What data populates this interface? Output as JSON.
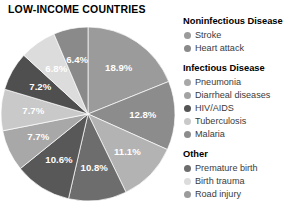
{
  "title": "LOW-INCOME COUNTRIES",
  "chart_data": {
    "type": "pie",
    "title": "LOW-INCOME COUNTRIES",
    "xlabel": "",
    "ylabel": "",
    "legend_position": "right",
    "grid": false,
    "unit": "%",
    "categories": [
      "Stroke",
      "Heart attack",
      "Pneumonia",
      "Diarrheal diseases",
      "HIV/AIDS",
      "Tuberculosis",
      "Malaria",
      "Premature birth",
      "Birth trauma",
      "Road injury"
    ],
    "values": [
      18.9,
      12.8,
      11.1,
      10.8,
      10.6,
      7.7,
      7.7,
      7.2,
      6.8,
      6.4
    ],
    "labels": [
      "18.9%",
      "12.8%",
      "11.1%",
      "10.8%",
      "10.6%",
      "7.7%",
      "7.7%",
      "7.2%",
      "6.8%",
      "6.4%"
    ],
    "colors": [
      "#9b9b9b",
      "#8c8c8c",
      "#b3b3b3",
      "#6d6d6d",
      "#585858",
      "#a8a8a8",
      "#c9c9c9",
      "#4f4f4f",
      "#dcdcdc",
      "#8a8a8a"
    ],
    "slices": [
      {
        "label": "18.9%",
        "value": 18.9,
        "color": "#9b9b9b",
        "name": "Stroke"
      },
      {
        "label": "12.8%",
        "value": 12.8,
        "color": "#8c8c8c",
        "name": "Heart attack"
      },
      {
        "label": "11.1%",
        "value": 11.1,
        "color": "#b3b3b3",
        "name": "Pneumonia"
      },
      {
        "label": "10.8%",
        "value": 10.8,
        "color": "#6d6d6d",
        "name": "Diarrheal diseases"
      },
      {
        "label": "10.6%",
        "value": 10.6,
        "color": "#585858",
        "name": "HIV/AIDS"
      },
      {
        "label": "7.7%",
        "value": 7.7,
        "color": "#a8a8a8",
        "name": "Tuberculosis"
      },
      {
        "label": "7.7%",
        "value": 7.7,
        "color": "#c9c9c9",
        "name": "Malaria"
      },
      {
        "label": "7.2%",
        "value": 7.2,
        "color": "#4f4f4f",
        "name": "Premature birth"
      },
      {
        "label": "6.8%",
        "value": 6.8,
        "color": "#dcdcdc",
        "name": "Birth trauma"
      },
      {
        "label": "6.4%",
        "value": 6.4,
        "color": "#8a8a8a",
        "name": "Road injury"
      }
    ]
  },
  "legend": {
    "groups": [
      {
        "heading": "Noninfectious Disease",
        "items": [
          {
            "label": "Stroke",
            "color": "#9b9b9b"
          },
          {
            "label": "Heart attack",
            "color": "#8a8a8a"
          }
        ]
      },
      {
        "heading": "Infectious Disease",
        "items": [
          {
            "label": "Pneumonia",
            "color": "#a8a8a8"
          },
          {
            "label": "Diarrheal diseases",
            "color": "#a3a3a3"
          },
          {
            "label": "HIV/AIDS",
            "color": "#545454"
          },
          {
            "label": "Tuberculosis",
            "color": "#c9c9c9"
          },
          {
            "label": "Malaria",
            "color": "#8c8c8c"
          }
        ]
      },
      {
        "heading": "Other",
        "items": [
          {
            "label": "Premature birth",
            "color": "#6d6d6d"
          },
          {
            "label": "Birth trauma",
            "color": "#dcdcdc"
          },
          {
            "label": "Road injury",
            "color": "#9b9b9b"
          }
        ]
      }
    ]
  }
}
